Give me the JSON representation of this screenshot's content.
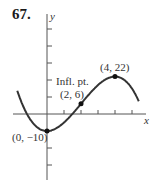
{
  "problem_number": "67.",
  "chart_data": {
    "type": "line",
    "title": "",
    "function": "f(x) = -x^3 + 6x^2 - 10",
    "xlabel": "x",
    "ylabel": "y",
    "xlim": [
      -2.0,
      5.6
    ],
    "ylim": [
      -30,
      50
    ],
    "x_tick_step": 1,
    "y_tick_step": 10,
    "grid": false,
    "legend": null,
    "points": [
      {
        "x": 0,
        "y": -10,
        "label": "(0, −10)"
      },
      {
        "x": 2,
        "y": 6,
        "label": "(2, 6)",
        "note": "Infl. pt."
      },
      {
        "x": 4,
        "y": 22,
        "label": "(4, 22)"
      }
    ]
  },
  "labels": {
    "min": "(0, −10)",
    "infl_title": "Infl. pt.",
    "infl": "(2, 6)",
    "max": "(4, 22)",
    "x": "x",
    "y": "y"
  }
}
